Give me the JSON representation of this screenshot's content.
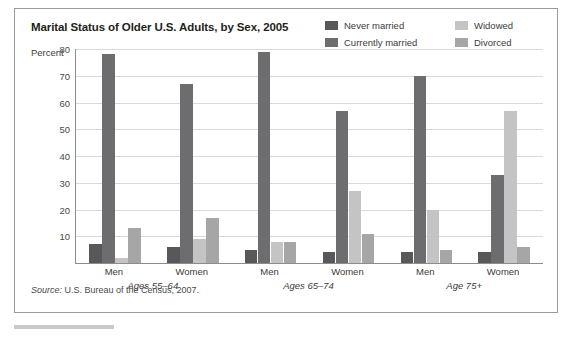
{
  "figure": {
    "title": "Marital Status of Older U.S. Adults, by Sex, 2005",
    "percent_axis_label": "Percent",
    "source_prefix": "Source:",
    "source_text": " U.S. Bureau of the Census, 2007."
  },
  "legend": {
    "items": [
      {
        "label": "Never married",
        "color": "#58585a"
      },
      {
        "label": "Widowed",
        "color": "#c4c4c4"
      },
      {
        "label": "Currently married",
        "color": "#6d6d6f"
      },
      {
        "label": "Divorced",
        "color": "#a6a6a6"
      }
    ]
  },
  "chart_data": {
    "type": "bar",
    "title": "Marital Status of Older U.S. Adults, by Sex, 2005",
    "xlabel": "",
    "ylabel": "Percent",
    "ylim": [
      0,
      80
    ],
    "yticks": [
      10,
      20,
      30,
      40,
      50,
      60,
      70,
      80
    ],
    "ytick_labels": [
      "10",
      "20",
      "30",
      "40",
      "50",
      "60",
      "70",
      "80"
    ],
    "grid": true,
    "legend_position": "top-right",
    "categories": [
      "Men, Ages 55–64",
      "Women, Ages 55–64",
      "Men, Ages 65–74",
      "Women, Ages 65–74",
      "Men, Age 75+",
      "Women, Age 75+"
    ],
    "group_labels": [
      "Ages 55–64",
      "Ages 65–74",
      "Age 75+"
    ],
    "sex_labels": [
      "Men",
      "Women",
      "Men",
      "Women",
      "Men",
      "Women"
    ],
    "series": [
      {
        "name": "Never married",
        "color": "#58585a",
        "values": [
          7,
          6,
          5,
          4,
          4,
          4
        ]
      },
      {
        "name": "Currently married",
        "color": "#6d6d6f",
        "values": [
          78,
          67,
          79,
          57,
          70,
          33
        ]
      },
      {
        "name": "Widowed",
        "color": "#c4c4c4",
        "values": [
          2,
          9,
          8,
          27,
          20,
          57
        ]
      },
      {
        "name": "Divorced",
        "color": "#a6a6a6",
        "values": [
          13,
          17,
          8,
          11,
          5,
          6
        ]
      }
    ],
    "source": "Source: U.S. Bureau of the Census, 2007."
  }
}
